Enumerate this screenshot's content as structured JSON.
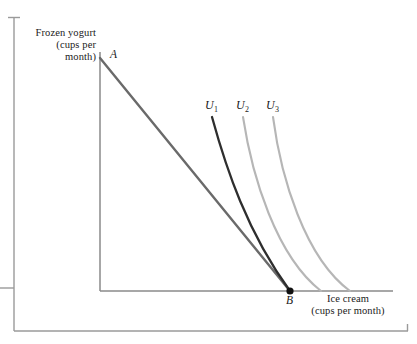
{
  "figure": {
    "background_color": "#ffffff"
  },
  "axes": {
    "y_axis_label": "Frozen yogurt\n(cups per\nmonth)",
    "x_axis_label": "Ice cream\n(cups per month)",
    "axis_color": "#8a8a8a",
    "origin": {
      "x": 100,
      "y": 291
    },
    "y_axis_top": 52,
    "x_axis_right": 393
  },
  "frame": {
    "rule_color": "#9a9a9a",
    "vertical_rule": {
      "x": 14,
      "y_top": 17,
      "y_bottom": 331
    },
    "horizontal_rule": {
      "y": 331,
      "x_left": 14,
      "x_right": 408
    },
    "top_tick": {
      "x": 14,
      "y": 17,
      "half_width": 6
    },
    "left_tick": {
      "x": 14,
      "y": 288,
      "length": 14
    },
    "right_tick": {
      "x": 408,
      "y": 331,
      "height": 7
    }
  },
  "points": [
    {
      "id": "A",
      "label": "A",
      "x": 100,
      "y": 58,
      "marker": "none"
    },
    {
      "id": "B",
      "label": "B",
      "x": 290,
      "y": 291,
      "marker": "filled-dot",
      "radius": 3.6,
      "color": "#111111"
    }
  ],
  "curves": [
    {
      "id": "budget-line",
      "name": "budget-constraint",
      "label": "",
      "color": "#6a6a6a",
      "width": 2.4,
      "path": "M 100 58 L 290 291"
    },
    {
      "id": "U1",
      "name": "indifference-curve-u1",
      "label": "U",
      "subscript": "1",
      "color": "#2e2e2e",
      "width": 2.3,
      "path": "M 212 117 C 226 168, 247 232, 290 291"
    },
    {
      "id": "U2",
      "name": "indifference-curve-u2",
      "label": "U",
      "subscript": "2",
      "color": "#b6b6b6",
      "width": 2.1,
      "path": "M 243 117 C 252 176, 276 256, 321 291"
    },
    {
      "id": "U3",
      "name": "indifference-curve-u3",
      "label": "U",
      "subscript": "3",
      "color": "#b6b6b6",
      "width": 2.1,
      "path": "M 273 117 C 281 178, 305 258, 350 291"
    }
  ],
  "chart_data": {
    "type": "line",
    "title": "",
    "xlabel": "Ice cream (cups per month)",
    "ylabel": "Frozen yogurt (cups per month)",
    "grid": false,
    "legend": "inline-curve-labels",
    "annotations": [
      "A",
      "B",
      "U1",
      "U2",
      "U3"
    ],
    "series": [
      {
        "name": "Budget line",
        "description": "straight line from A on vertical axis down to B on horizontal axis"
      },
      {
        "name": "U1",
        "description": "lowest indifference curve, tangent to budget line at point B"
      },
      {
        "name": "U2",
        "description": "middle indifference curve, lies above and right of U1"
      },
      {
        "name": "U3",
        "description": "highest indifference curve, lies above and right of U2"
      }
    ]
  }
}
